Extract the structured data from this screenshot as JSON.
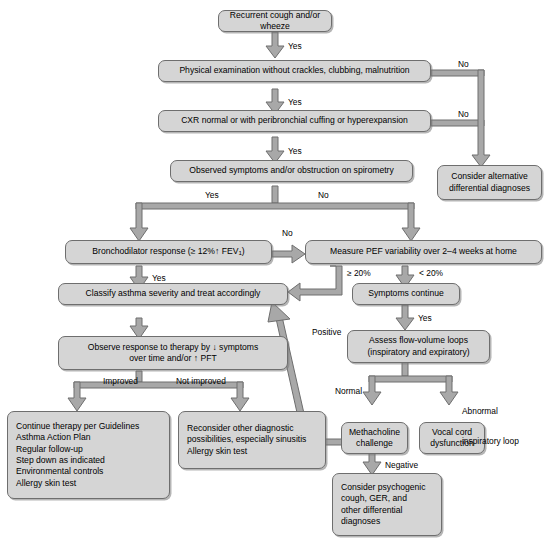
{
  "colors": {
    "node_fill": "#d5d5d5",
    "node_border": "#6e6e6e",
    "connector": "#9a9a9a",
    "connector_outline": "#6e6e6e",
    "background": "#ffffff",
    "text": "#000000"
  },
  "nodes": {
    "recurrent_cough": {
      "label": "Recurrent cough and/or wheeze"
    },
    "physical_exam": {
      "label": "Physical examination without crackles, clubbing, malnutrition"
    },
    "cxr": {
      "label": "CXR normal or with peribronchial cuffing or hyperexpansion"
    },
    "observed_symptoms": {
      "label": "Observed symptoms and/or obstruction on spirometry"
    },
    "consider_alternative": {
      "line1": "Consider alternative",
      "line2": "differential diagnoses"
    },
    "bronchodilator": {
      "pre": "Bronchodilator response (≥ 12%↑ FEV",
      "sub": "1",
      "post": ")"
    },
    "measure_pef": {
      "label": "Measure PEF variability over 2–4 weeks at home"
    },
    "classify_asthma": {
      "label": "Classify asthma severity and treat accordingly"
    },
    "symptoms_continue": {
      "label": "Symptoms continue"
    },
    "observe_response": {
      "line1": "Observe response to therapy by ↓ symptoms",
      "line2": "over time and/or ↑ PFT"
    },
    "assess_flow_volume": {
      "line1": "Assess flow-volume loops",
      "line2": "(inspiratory and expiratory)"
    },
    "continue_therapy": {
      "lines": [
        "Continue therapy per Guidelines",
        "Asthma Action Plan",
        "Regular follow-up",
        "Step down as indicated",
        "Environmental controls",
        "Allergy skin test"
      ]
    },
    "reconsider_other": {
      "lines": [
        "Reconsider other diagnostic",
        "possibilities, especially sinusitis",
        "Allergy skin test"
      ]
    },
    "methacholine": {
      "line1": "Methacholine",
      "line2": "challenge"
    },
    "vocal_cord": {
      "line1": "Vocal cord",
      "line2": "dysfunction"
    },
    "consider_psychogenic": {
      "lines": [
        "Consider psychogenic",
        "cough, GER, and",
        "other differential",
        "diagnoses"
      ]
    }
  },
  "edge_labels": {
    "yes_1": "Yes",
    "no_1": "No",
    "yes_2": "Yes",
    "no_2": "No",
    "yes_3": "Yes",
    "yes_4": "Yes",
    "no_4": "No",
    "no_5": "No",
    "yes_5": "Yes",
    "ge_20": "≥ 20%",
    "lt_20": "< 20%",
    "improved": "Improved",
    "not_improved": "Not improved",
    "positive": "Positive",
    "yes_6": "Yes",
    "normal": "Normal",
    "abnormal_1": "Abnormal",
    "abnormal_2": "inspiratory loop",
    "negative": "Negative"
  }
}
